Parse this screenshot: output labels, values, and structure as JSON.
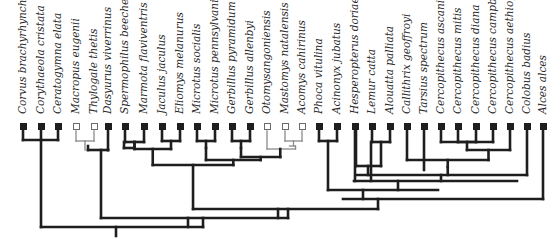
{
  "diagram": {
    "type": "phylogenetic-tree",
    "colors": {
      "branch": "#1e1e1e",
      "open_branch": "#8a8a8a",
      "filled_marker": "#1e1e1e",
      "open_marker": "#ffffff"
    },
    "taxa": [
      {
        "name": "Corvus brachyrhynchos",
        "x": 23,
        "marker": "filled"
      },
      {
        "name": "Corythaeola cristata",
        "x": 41,
        "marker": "filled"
      },
      {
        "name": "Ceratogymna elata",
        "x": 58,
        "marker": "filled"
      },
      {
        "name": "Macropus eugenii",
        "x": 76,
        "marker": "open"
      },
      {
        "name": "Thylogale thetis",
        "x": 94,
        "marker": "open"
      },
      {
        "name": "Dasyurus viverrinus",
        "x": 108,
        "marker": "filled"
      },
      {
        "name": "Spermophilus beecheyi",
        "x": 125,
        "marker": "filled"
      },
      {
        "name": "Marmota flaviventris",
        "x": 144,
        "marker": "filled"
      },
      {
        "name": "Jaculus jaculus",
        "x": 162,
        "marker": "filled"
      },
      {
        "name": "Eliomys melanurus",
        "x": 180,
        "marker": "filled"
      },
      {
        "name": "Microtus socialis",
        "x": 197,
        "marker": "filled"
      },
      {
        "name": "Microtus pennsylvanicus",
        "x": 215,
        "marker": "filled"
      },
      {
        "name": "Gerbillus pyramidum",
        "x": 232,
        "marker": "filled"
      },
      {
        "name": "Gerbillus allenbyi",
        "x": 250,
        "marker": "filled"
      },
      {
        "name": "Otomysangoniensis",
        "x": 267,
        "marker": "open"
      },
      {
        "name": "Mastomys natalensis",
        "x": 285,
        "marker": "open"
      },
      {
        "name": "Acomys cahirinus",
        "x": 302,
        "marker": "open"
      },
      {
        "name": "Phoca vitulina",
        "x": 319,
        "marker": "filled"
      },
      {
        "name": "Acinonyx jubatus",
        "x": 337,
        "marker": "filled"
      },
      {
        "name": "Hesperopterus doriae",
        "x": 355,
        "marker": "filled"
      },
      {
        "name": "Lemur catta",
        "x": 372,
        "marker": "filled"
      },
      {
        "name": "Alouatta palliata",
        "x": 390,
        "marker": "filled"
      },
      {
        "name": "Callithrix geoffroyi",
        "x": 407,
        "marker": "filled"
      },
      {
        "name": "Tarsius spectrum",
        "x": 424,
        "marker": "filled"
      },
      {
        "name": "Cercopithecus ascanius",
        "x": 441,
        "marker": "filled"
      },
      {
        "name": "Cercopithecus mitis",
        "x": 458,
        "marker": "filled"
      },
      {
        "name": "Cercopithecus diana",
        "x": 476,
        "marker": "filled"
      },
      {
        "name": "Cercopithecus campbelli",
        "x": 493,
        "marker": "filled"
      },
      {
        "name": "Cercopithecus aethiops",
        "x": 510,
        "marker": "filled"
      },
      {
        "name": "Colobus badius",
        "x": 527,
        "marker": "filled"
      },
      {
        "name": "Alces alces",
        "x": 543,
        "marker": "filled"
      }
    ]
  }
}
